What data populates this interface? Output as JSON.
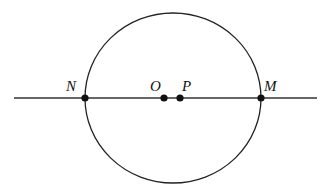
{
  "diagram": {
    "type": "geometry",
    "circle": {
      "cx": 173,
      "cy": 98,
      "rx": 88,
      "ry": 85,
      "stroke": "#222222"
    },
    "line": {
      "x1": 14,
      "y1": 98,
      "x2": 317,
      "y2": 98,
      "stroke": "#333333"
    },
    "points": [
      {
        "id": "N",
        "label": "N",
        "x": 85,
        "y": 98,
        "label_x": 66,
        "label_y": 91
      },
      {
        "id": "O",
        "label": "O",
        "x": 164,
        "y": 98,
        "label_x": 150,
        "label_y": 91
      },
      {
        "id": "P",
        "label": "P",
        "x": 180,
        "y": 98,
        "label_x": 182,
        "label_y": 91
      },
      {
        "id": "M",
        "label": "M",
        "x": 261,
        "y": 98,
        "label_x": 264,
        "label_y": 91
      }
    ]
  }
}
